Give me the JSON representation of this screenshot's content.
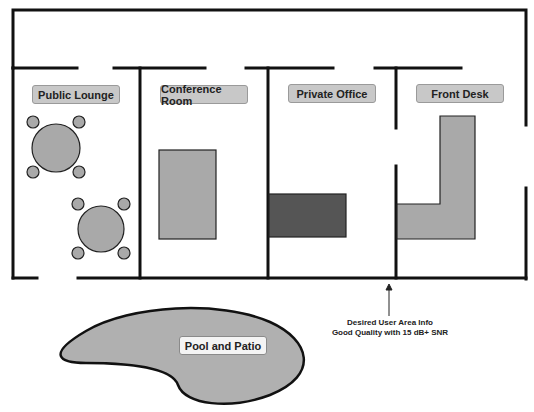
{
  "diagram": {
    "type": "floor-plan",
    "rooms": [
      {
        "id": "public-lounge",
        "label": "Public Lounge"
      },
      {
        "id": "conference-room",
        "label": "Conference Room"
      },
      {
        "id": "private-office",
        "label": "Private Office"
      },
      {
        "id": "front-desk",
        "label": "Front Desk"
      }
    ],
    "outdoor": {
      "label": "Pool and Patio"
    },
    "annotation": {
      "line1": "Desired User Area Info",
      "line2": "Good Quality with 15 dB+ SNR"
    },
    "colors": {
      "wall": "#111111",
      "furniture": "#a9a9a9",
      "furniture_dark": "#555555",
      "label_bg": "#c8c8c8",
      "pool": "#b0b0b0"
    }
  }
}
